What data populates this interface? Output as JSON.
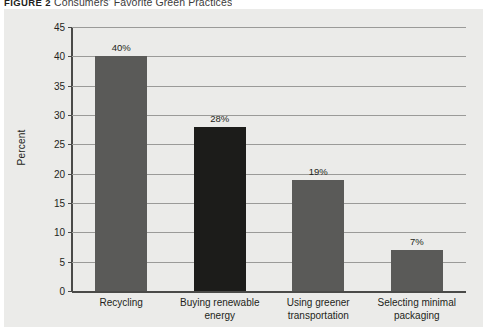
{
  "caption": {
    "figure_label": "FIGURE 2",
    "title": "Consumers' Favorite Green Practices"
  },
  "colors": {
    "panel_background": "#ebebe9",
    "bar_gray": "#5a5a58",
    "bar_black": "#1c1c1a",
    "gridline": "#9a9a98",
    "axis": "#4a4a48",
    "text": "#231f20"
  },
  "chart_data": {
    "type": "bar",
    "title": "Consumers' Favorite Green Practices",
    "xlabel": "",
    "ylabel": "Percent",
    "ylim": [
      0,
      45
    ],
    "yticks": [
      0,
      5,
      10,
      15,
      20,
      25,
      30,
      35,
      40,
      45
    ],
    "ytick_labels": [
      "0",
      "5",
      "10",
      "15",
      "20",
      "25",
      "30",
      "35",
      "40",
      "45"
    ],
    "grid": true,
    "legend": "none",
    "categories": [
      "Recycling",
      "Buying renewable\nenergy",
      "Using greener\ntransportation",
      "Selecting minimal\npackaging"
    ],
    "values": [
      40,
      28,
      19,
      7
    ],
    "data_labels": [
      "40%",
      "28%",
      "19%",
      "7%"
    ],
    "bar_colors": [
      "#5a5a58",
      "#1c1c1a",
      "#5a5a58",
      "#5a5a58"
    ]
  }
}
